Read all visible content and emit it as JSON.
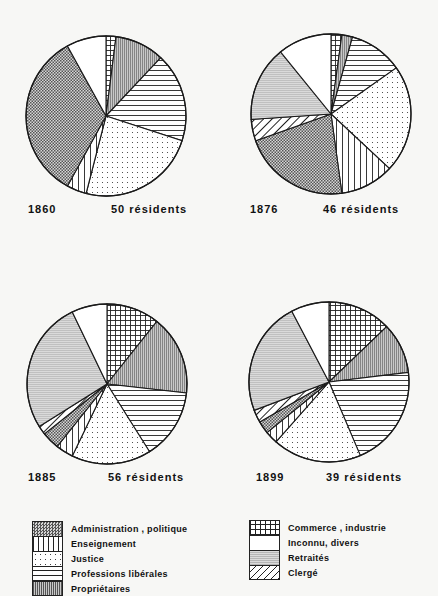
{
  "categories": [
    {
      "key": "commerce",
      "label": "Commerce , industrie",
      "pattern": "grid"
    },
    {
      "key": "proprietaires",
      "label": "Propriétaires",
      "pattern": "vlines-dense"
    },
    {
      "key": "prof_liberales",
      "label": "Professions  libérales",
      "pattern": "hlines"
    },
    {
      "key": "justice",
      "label": "Justice",
      "pattern": "dots"
    },
    {
      "key": "enseignement",
      "label": "Enseignement",
      "pattern": "vlines"
    },
    {
      "key": "administration",
      "label": "Administration , politique",
      "pattern": "checker"
    },
    {
      "key": "clerge",
      "label": "Clergé",
      "pattern": "diag"
    },
    {
      "key": "retraites",
      "label": "Retraités",
      "pattern": "gray-hlines"
    },
    {
      "key": "inconnu",
      "label": "Inconnu, divers",
      "pattern": "blank"
    }
  ],
  "legend": {
    "left": [
      "Administration , politique",
      "Enseignement",
      "Justice",
      "Professions  libérales",
      "Propriétaires"
    ],
    "right": [
      "Commerce , industrie",
      "Inconnu, divers",
      "Retraités",
      "Clergé"
    ]
  },
  "charts": [
    {
      "year": "1860",
      "residents_label": "50 résidents"
    },
    {
      "year": "1876",
      "residents_label": "46 résidents"
    },
    {
      "year": "1885",
      "residents_label": "56 résidents"
    },
    {
      "year": "1899",
      "residents_label": "39 résidents"
    }
  ],
  "chart_data": [
    {
      "type": "pie",
      "title": "1860",
      "subtitle": "50 résidents",
      "categories": [
        "Commerce , industrie",
        "Propriétaires",
        "Professions libérales",
        "Justice",
        "Enseignement",
        "Administration , politique",
        "Clergé",
        "Retraités",
        "Inconnu, divers"
      ],
      "values": [
        1,
        5,
        9,
        12,
        2,
        17,
        0,
        0,
        4
      ]
    },
    {
      "type": "pie",
      "title": "1876",
      "subtitle": "46 résidents",
      "categories": [
        "Commerce , industrie",
        "Propriétaires",
        "Professions libérales",
        "Justice",
        "Enseignement",
        "Administration , politique",
        "Clergé",
        "Retraités",
        "Inconnu, divers"
      ],
      "values": [
        1,
        1,
        5,
        10,
        5,
        10,
        2,
        7,
        5
      ]
    },
    {
      "type": "pie",
      "title": "1885",
      "subtitle": "56 résidents",
      "categories": [
        "Commerce , industrie",
        "Propriétaires",
        "Professions libérales",
        "Justice",
        "Enseignement",
        "Administration , politique",
        "Clergé",
        "Retraités",
        "Inconnu, divers"
      ],
      "values": [
        6,
        9,
        8,
        9,
        2,
        2,
        1,
        15,
        4
      ]
    },
    {
      "type": "pie",
      "title": "1899",
      "subtitle": "39 résidents",
      "categories": [
        "Commerce , industrie",
        "Propriétaires",
        "Professions libérales",
        "Justice",
        "Enseignement",
        "Administration , politique",
        "Clergé",
        "Retraités",
        "Inconnu, divers"
      ],
      "values": [
        5,
        4,
        8,
        7,
        1,
        1,
        1,
        9,
        3
      ]
    }
  ]
}
